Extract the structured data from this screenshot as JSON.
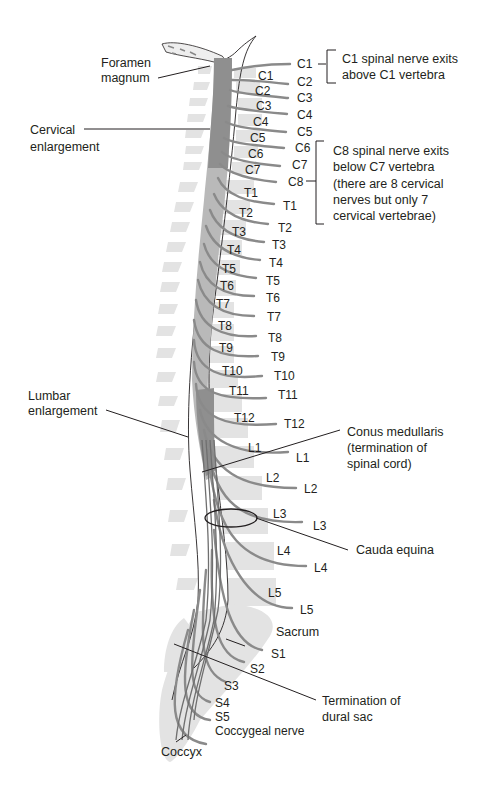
{
  "diagram": {
    "colors": {
      "cord": "#8f8f8f",
      "cord_light": "#b9b9b9",
      "vertebra": "#e3e3e3",
      "nerve": "#8a8a8a",
      "text": "#231f20"
    },
    "left_labels": {
      "foramen_magnum": [
        "Foramen",
        "magnum"
      ],
      "cervical_enlargement": [
        "Cervical",
        "enlargement"
      ],
      "lumbar_enlargement": [
        "Lumbar",
        "enlargement"
      ],
      "coccyx": "Coccyx"
    },
    "vertebra_labels": [
      "C1",
      "C2",
      "C3",
      "C4",
      "C5",
      "C6",
      "C7",
      "T1",
      "T2",
      "T3",
      "T4",
      "T5",
      "T6",
      "T7",
      "T8",
      "T9",
      "T10",
      "T11",
      "T12",
      "L1",
      "L2",
      "L3",
      "L4",
      "L5"
    ],
    "nerve_labels": [
      "C1",
      "C2",
      "C3",
      "C4",
      "C5",
      "C6",
      "C7",
      "C8",
      "T1",
      "T2",
      "T3",
      "T4",
      "T5",
      "T6",
      "T7",
      "T8",
      "T9",
      "T10",
      "T11",
      "T12",
      "L1",
      "L2",
      "L3",
      "L4",
      "L5",
      "S1",
      "S2",
      "S3",
      "S4",
      "S5",
      "Coccygeal nerve"
    ],
    "right_labels": {
      "sacrum": "Sacrum",
      "conus_medullaris": [
        "Conus medullaris",
        "(termination of",
        "spinal cord)"
      ],
      "cauda_equina": "Cauda equina",
      "dural_sac": [
        "Termination of",
        "dural sac"
      ]
    },
    "notes": {
      "c1_note": [
        "C1 spinal nerve exits",
        "above C1 vertebra"
      ],
      "c8_note": [
        "C8 spinal nerve exits",
        "below C7 vertebra",
        "(there are 8 cervical",
        "nerves but only 7",
        "cervical vertebrae)"
      ]
    }
  }
}
